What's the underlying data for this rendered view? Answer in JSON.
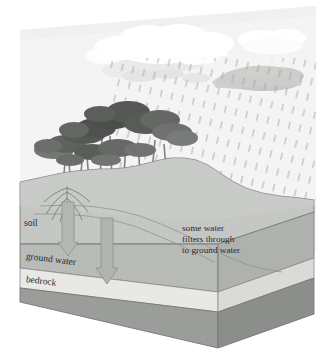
{
  "diagram": {
    "background_color": "#ffffff",
    "backdrop_color": "#f2f2f2"
  },
  "labels": {
    "soil": "soil",
    "ground_water": "ground water",
    "bedrock": "bedrock",
    "callout_line1": "some water",
    "callout_line2": "filters through",
    "callout_line3": "to ground water"
  },
  "layers": [
    {
      "name": "soil",
      "label": "soil",
      "color": "#b9bcb9"
    },
    {
      "name": "ground-water",
      "label": "ground water",
      "color": "#e3e4e1"
    },
    {
      "name": "bedrock",
      "label": "bedrock",
      "color": "#939693"
    }
  ],
  "sky": {
    "clouds": [
      {
        "name": "cloud-white-main",
        "color": "#fdfdfd",
        "tone": "white"
      },
      {
        "name": "cloud-white-right",
        "color": "#fbfbfb",
        "tone": "white"
      },
      {
        "name": "cloud-gray-right",
        "color": "#c9cbc8",
        "tone": "gray"
      },
      {
        "name": "cloud-gray-mid",
        "color": "#dcdedb",
        "tone": "gray"
      }
    ],
    "rain": {
      "name": "rain-dashes",
      "color": "#9a9d9a",
      "style": "dashed-diagonal",
      "count": 96
    }
  },
  "vegetation": {
    "name": "tree-cluster",
    "tree_count": 7,
    "canopy_color": "#6d706d",
    "canopy_dark": "#4d504d",
    "trunk_color": "#8e918e"
  },
  "arrows": [
    {
      "name": "infiltration-arrow-left",
      "direction": "down",
      "color": "#a8aba8"
    },
    {
      "name": "infiltration-arrow-right",
      "direction": "down",
      "color": "#a8aba8"
    }
  ],
  "colors": {
    "top_surface": "#c6c8c5",
    "front_soil": "#b9bcb9",
    "side_soil": "#aeb1ae",
    "ground_water_front": "#e8e9e6",
    "ground_water_side": "#dadbd8",
    "bedrock_front": "#9b9e9b",
    "bedrock_side": "#8b8e8b",
    "outline": "#6f726f",
    "text": "#2b2b2b"
  }
}
